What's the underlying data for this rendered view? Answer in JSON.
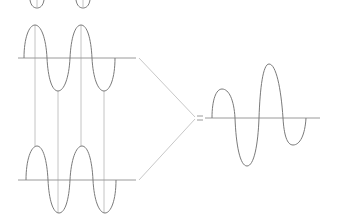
{
  "diagram": {
    "title": "",
    "colors": {
      "wave": "#7a7a7a",
      "axis": "#9a9a9a",
      "guide": "#c4c4c4",
      "connector": "#c8c8c8"
    },
    "waves": [
      {
        "name": "top-partial-wave",
        "visible_part": "trough bottoms cut off at top edge"
      },
      {
        "name": "wave-a",
        "axis_y": 58,
        "peaks": 2,
        "troughs": 2
      },
      {
        "name": "wave-b",
        "axis_y": 180,
        "peaks": 2,
        "troughs": 2
      },
      {
        "name": "resultant-wave",
        "axis_y": 118,
        "peaks": 2,
        "troughs": 2,
        "description": "varying amplitude"
      }
    ],
    "symbols": {
      "equals": "="
    }
  }
}
